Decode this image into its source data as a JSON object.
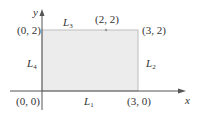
{
  "diagram": {
    "type": "region-boundary",
    "fill_color": "#ececec",
    "edge_color": "#bdbdbd",
    "axis_color": "#555555",
    "axes": {
      "x_label": "x",
      "y_label": "y"
    },
    "vertices": [
      {
        "label": "(0, 0)"
      },
      {
        "label": "(3, 0)"
      },
      {
        "label": "(3, 2)"
      },
      {
        "label": "(0, 2)"
      }
    ],
    "point": {
      "label": "(2, 2)"
    },
    "edges": [
      {
        "name": "L",
        "sub": "1"
      },
      {
        "name": "L",
        "sub": "2"
      },
      {
        "name": "L",
        "sub": "3"
      },
      {
        "name": "L",
        "sub": "4"
      }
    ]
  }
}
